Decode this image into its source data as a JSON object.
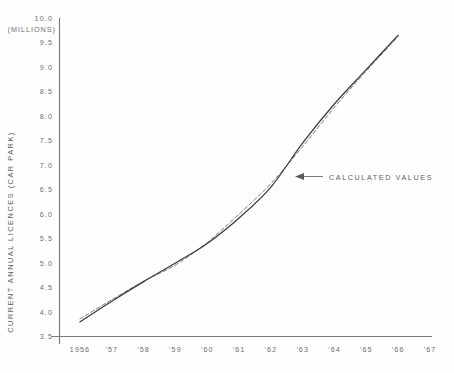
{
  "chart_data": {
    "type": "line",
    "title": "",
    "subtitle": "",
    "ylabel": "CURRENT ANNUAL LICENCES (CAR PARK)",
    "yunits": "(MILLIONS)",
    "xlabel": "",
    "xlim": [
      1956,
      1967
    ],
    "ylim": [
      3.5,
      10.0
    ],
    "grid": false,
    "legend_position": "none",
    "x": [
      1956,
      1957,
      1958,
      1959,
      1960,
      1961,
      1962,
      1963,
      1964,
      1965,
      1966
    ],
    "xtick_labels": [
      "1956",
      "'57",
      "'58",
      "'59",
      "'60",
      "'61",
      "'62",
      "'63",
      "'64",
      "'65",
      "'66",
      "'67"
    ],
    "xtick_values": [
      1956,
      1957,
      1958,
      1959,
      1960,
      1961,
      1962,
      1963,
      1964,
      1965,
      1966,
      1967
    ],
    "ytick_labels": [
      "10.0",
      "9.5",
      "9.0",
      "8.5",
      "8.0",
      "7.5",
      "7.0",
      "6.5",
      "6.0",
      "5.5",
      "5.0",
      "4.5",
      "4.0",
      "3.5"
    ],
    "ytick_values": [
      10.0,
      9.5,
      9.0,
      8.5,
      8.0,
      7.5,
      7.0,
      6.5,
      6.0,
      5.5,
      5.0,
      4.5,
      4.0,
      3.5
    ],
    "series": [
      {
        "name": "observed",
        "style": "solid",
        "color": "#3b3b3b",
        "values": [
          3.8,
          4.22,
          4.62,
          5.0,
          5.4,
          5.92,
          6.55,
          7.45,
          8.25,
          8.95,
          9.65
        ]
      },
      {
        "name": "calculated",
        "style": "dashed",
        "color": "#7c7c7c",
        "values": [
          3.86,
          4.25,
          4.63,
          4.96,
          5.42,
          6.0,
          6.62,
          7.38,
          8.18,
          8.92,
          9.62
        ]
      }
    ],
    "annotations": [
      {
        "text": "CALCULATED VALUES",
        "x": 1962.0,
        "y": 7.05,
        "arrow": "left"
      }
    ]
  }
}
